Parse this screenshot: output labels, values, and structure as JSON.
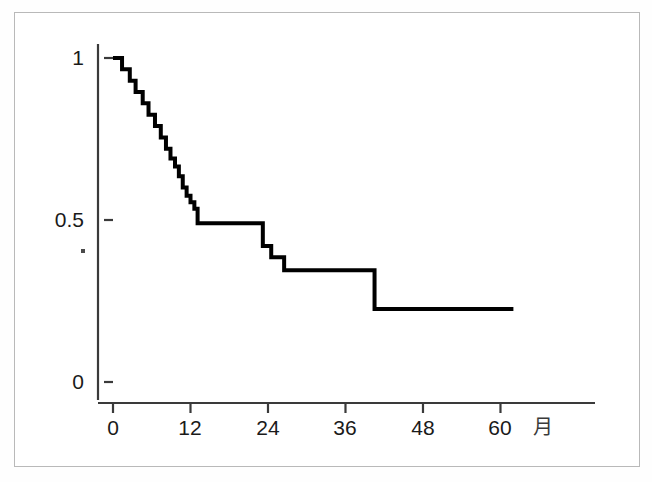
{
  "figure": {
    "type": "kaplan-meier-survival-plot",
    "background_color": "#ffffff",
    "frame_border_color": "#b9b9b9",
    "curve_color": "#000000",
    "axis_color": "#333333"
  },
  "axes": {
    "x_title": "月",
    "y_title": "",
    "x_tick_labels": [
      "0",
      "12",
      "24",
      "36",
      "48",
      "60"
    ],
    "y_tick_labels": [
      "1",
      "0.5",
      "0"
    ]
  },
  "chart_data": {
    "type": "line",
    "subtype": "kaplan-meier-step-survival",
    "title": "",
    "xlabel": "月",
    "ylabel": "",
    "xlim": [
      0,
      62
    ],
    "ylim": [
      0,
      1
    ],
    "xticks": [
      0,
      12,
      24,
      36,
      48,
      60
    ],
    "yticks": [
      0,
      0.5,
      1
    ],
    "xtick_labels": [
      "0",
      "12",
      "24",
      "36",
      "48",
      "60"
    ],
    "ytick_labels": [
      "0",
      "0.5",
      "1"
    ],
    "grid": false,
    "legend": false,
    "step_style": "post",
    "series": [
      {
        "name": "Overall survival",
        "x": [
          0,
          1.4,
          1.4,
          2.6,
          2.6,
          3.5,
          3.5,
          4.6,
          4.6,
          5.5,
          5.5,
          6.5,
          6.5,
          7.4,
          7.4,
          8.2,
          8.2,
          8.9,
          8.9,
          9.6,
          9.6,
          10.2,
          10.2,
          10.8,
          10.8,
          11.4,
          11.4,
          12.0,
          12.0,
          12.6,
          12.6,
          13.1,
          13.1,
          13.9,
          13.9,
          23.2,
          23.2,
          24.5,
          24.5,
          26.5,
          26.5,
          28.5,
          28.5,
          40.5,
          40.5,
          62.0
        ],
        "y": [
          1.0,
          1.0,
          0.965,
          0.965,
          0.93,
          0.93,
          0.895,
          0.895,
          0.86,
          0.86,
          0.825,
          0.825,
          0.79,
          0.79,
          0.755,
          0.755,
          0.72,
          0.72,
          0.69,
          0.69,
          0.665,
          0.665,
          0.635,
          0.635,
          0.6,
          0.6,
          0.575,
          0.575,
          0.555,
          0.555,
          0.535,
          0.535,
          0.49,
          0.49,
          0.49,
          0.49,
          0.42,
          0.42,
          0.385,
          0.385,
          0.345,
          0.345,
          0.345,
          0.345,
          0.225,
          0.225
        ],
        "color": "#000000",
        "linewidth": 4
      }
    ],
    "annotations": [
      {
        "label": "survival at 12 months",
        "x": 12,
        "y": 0.575
      },
      {
        "label": "plateau value 0.49 from month 14 to 23",
        "x": 18,
        "y": 0.49
      },
      {
        "label": "plateau value 0.345 from month 28.5 to 40.5",
        "x": 34,
        "y": 0.345
      },
      {
        "label": "final plateau value 0.225 to month 62",
        "x": 50,
        "y": 0.225
      }
    ]
  },
  "geometry": {
    "origin_px": {
      "x": 113,
      "y": 382
    },
    "px_per_month": 6.458,
    "px_per_unit_y": 324,
    "x_axis_left_px": 98,
    "x_axis_right_px": 595,
    "y_axis_top_px": 44,
    "y_axis_bottom_px": 400
  }
}
